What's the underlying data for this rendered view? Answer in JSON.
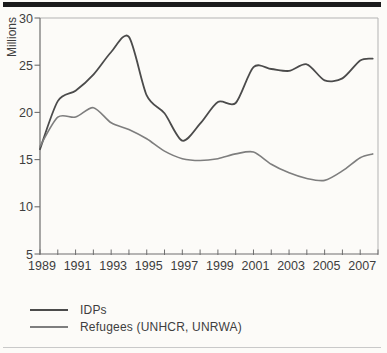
{
  "page": {
    "background": "#fcfbf8",
    "top_rule_color": "#1b1b1b",
    "bottom_rule_color": "#c9c9c9",
    "text_color": "#3e3e3e",
    "axis_color": "#6e6e6e",
    "frame_color": "#b3b3b3"
  },
  "chart_data": {
    "type": "line",
    "title": "",
    "xlabel": "",
    "ylabel": "Millions",
    "ylim": [
      5,
      30
    ],
    "xlim": [
      1989,
      2008
    ],
    "y_ticks": [
      5,
      10,
      15,
      20,
      25,
      30
    ],
    "x_tick_labels": [
      1989,
      1991,
      1993,
      1995,
      1997,
      1999,
      2001,
      2003,
      2005,
      2007
    ],
    "x_minor_ticks": {
      "from": 1989,
      "to": 2008,
      "step": 1
    },
    "grid": false,
    "legend_position": "below-left",
    "x": [
      1989,
      1990,
      1991,
      1992,
      1993,
      1994,
      1995,
      1996,
      1997,
      1998,
      1999,
      2000,
      2001,
      2002,
      2003,
      2004,
      2005,
      2006,
      2007,
      2007.7
    ],
    "series": [
      {
        "name": "IDPs",
        "color": "#4b4b4b",
        "stroke_width": 1.8,
        "values": [
          16.1,
          21.2,
          22.3,
          24.0,
          26.4,
          28.0,
          21.8,
          19.9,
          17.0,
          18.8,
          21.1,
          21.0,
          24.8,
          24.6,
          24.4,
          25.1,
          23.4,
          23.6,
          25.5,
          25.7
        ]
      },
      {
        "name": "Refugees (UNHCR, UNRWA)",
        "color": "#7e7e7e",
        "stroke_width": 1.6,
        "values": [
          16.4,
          19.5,
          19.5,
          20.5,
          18.9,
          18.2,
          17.2,
          15.9,
          15.1,
          14.9,
          15.1,
          15.6,
          15.8,
          14.5,
          13.6,
          13.0,
          12.8,
          13.8,
          15.2,
          15.6
        ]
      }
    ]
  }
}
